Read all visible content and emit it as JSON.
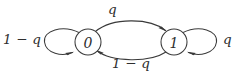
{
  "diagram": {
    "type": "state-transition-diagram",
    "background_color": "#ffffff",
    "stroke_color": "#3a3a3a",
    "text_color": "#2e2e2e",
    "states": [
      {
        "id": "state-0",
        "label": "0",
        "cx": 88,
        "cy": 42,
        "r": 13
      },
      {
        "id": "state-1",
        "label": "1",
        "cx": 174,
        "cy": 42,
        "r": 13
      }
    ],
    "transitions": [
      {
        "id": "edge-0-to-1",
        "from": "0",
        "to": "1",
        "label": "q",
        "position": "top"
      },
      {
        "id": "edge-1-to-0",
        "from": "1",
        "to": "0",
        "label": "1 − q",
        "position": "bottom"
      },
      {
        "id": "loop-0",
        "from": "0",
        "to": "0",
        "label": "1 − q",
        "position": "left"
      },
      {
        "id": "loop-1",
        "from": "1",
        "to": "1",
        "label": "q",
        "position": "right"
      }
    ]
  }
}
